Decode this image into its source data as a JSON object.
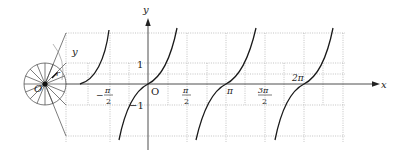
{
  "diagram": {
    "axes": {
      "x_label": "x",
      "y_label": "y",
      "origin_label": "O"
    },
    "circle": {
      "center_label": "O",
      "radius_label": "r",
      "angle_label": "y",
      "spokes": 16
    },
    "x_ticks": [
      {
        "label_num": "π",
        "label_den": "2",
        "sign": "−",
        "name": "neg-pi-over-2"
      },
      {
        "label_num": "π",
        "label_den": "2",
        "sign": "",
        "name": "pi-over-2"
      },
      {
        "label": "π",
        "name": "pi"
      },
      {
        "label_num": "3π",
        "label_den": "2",
        "sign": "",
        "name": "three-pi-over-2"
      },
      {
        "label": "2π",
        "name": "two-pi"
      }
    ],
    "y_ticks": [
      {
        "label": "1"
      },
      {
        "label": "−1"
      }
    ],
    "curve": "y = tan x",
    "branches": 4,
    "colors": {
      "curve": "#1a1a1a",
      "axis": "#222222",
      "grid": "#9a9a9a"
    }
  }
}
